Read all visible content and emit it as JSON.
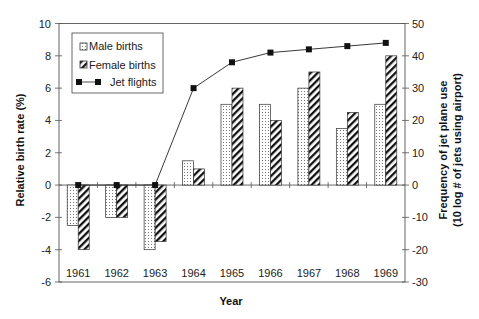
{
  "chart_data": {
    "type": "bar",
    "title": "",
    "xlabel": "Year",
    "ylabel": "Relative birth rate (%)",
    "y2label": [
      "Frequency of jet plane use",
      "(10 log # of jets using airport)"
    ],
    "categories": [
      "1961",
      "1962",
      "1963",
      "1964",
      "1965",
      "1966",
      "1967",
      "1968",
      "1969"
    ],
    "ylim": [
      -6,
      10
    ],
    "y_ticks": [
      10,
      8,
      6,
      4,
      2,
      0,
      -2,
      -4,
      -6
    ],
    "y2lim": [
      -30,
      50
    ],
    "y2_ticks": [
      50,
      40,
      30,
      20,
      10,
      0,
      -10,
      -20,
      -30
    ],
    "grid": false,
    "legend_position": "top-left",
    "series": [
      {
        "name": "Male births",
        "type": "bar",
        "axis": "left",
        "pattern": "dotted",
        "values": [
          -2.5,
          -2.0,
          -4.0,
          1.5,
          5.0,
          5.0,
          6.0,
          3.5,
          5.0
        ]
      },
      {
        "name": "Female births",
        "type": "bar",
        "axis": "left",
        "pattern": "diagonal-hatch",
        "values": [
          -4.0,
          -2.0,
          -3.5,
          1.0,
          6.0,
          4.0,
          7.0,
          4.5,
          8.0
        ]
      },
      {
        "name": "Jet flights",
        "type": "line",
        "axis": "right",
        "marker": "square",
        "values": [
          0,
          0,
          0,
          30,
          38,
          41,
          42,
          43,
          44
        ]
      }
    ],
    "colors": {
      "axis": "#555555",
      "marker": "#111111",
      "hatch": "#111111",
      "dot": "#666666"
    }
  }
}
